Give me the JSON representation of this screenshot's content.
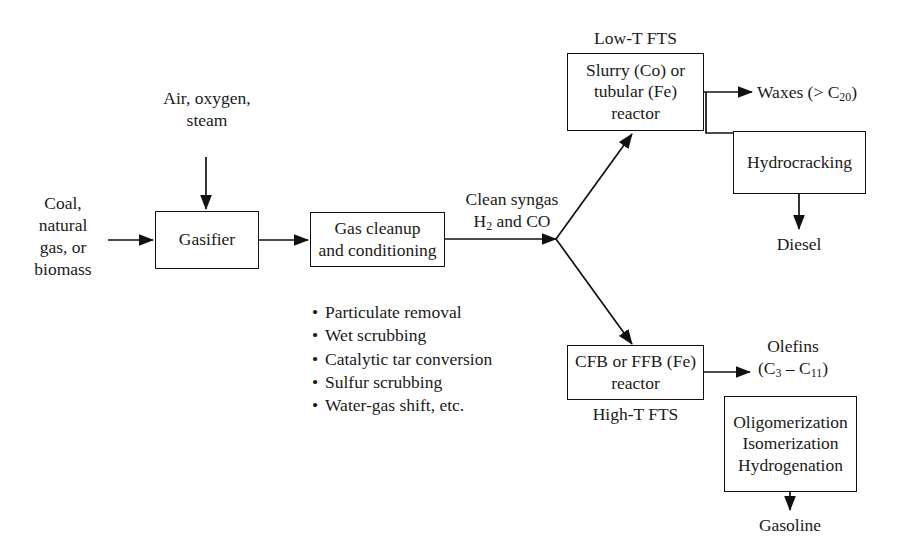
{
  "diagram": {
    "stroke_color": "#111111",
    "background_color": "#ffffff",
    "text_color": "#1a1a1a"
  },
  "inputs": {
    "feedstock_label": "Coal,\nnatural\ngas, or\nbiomass",
    "feedstock_line1": "Coal,",
    "feedstock_line2": "natural",
    "feedstock_line3": "gas, or",
    "feedstock_line4": "biomass",
    "oxidant_line1": "Air, oxygen,",
    "oxidant_line2": "steam"
  },
  "boxes": {
    "gasifier": "Gasifier",
    "gas_cleanup_line1": "Gas cleanup",
    "gas_cleanup_line2": "and conditioning",
    "lowt_reactor_line1": "Slurry (Co) or",
    "lowt_reactor_line2": "tubular (Fe)",
    "lowt_reactor_line3": "reactor",
    "hydrocracking": "Hydrocracking",
    "hight_reactor_line1": "CFB or FFB (Fe)",
    "hight_reactor_line2": "reactor",
    "upgrading_line1": "Oligomerization",
    "upgrading_line2": "Isomerization",
    "upgrading_line3": "Hydrogenation"
  },
  "annotations": {
    "low_t_fts": "Low-T FTS",
    "high_t_fts": "High-T FTS",
    "clean_syngas_line1": "Clean syngas",
    "clean_syngas_line2_prefix": "H",
    "clean_syngas_line2_sub": "2",
    "clean_syngas_line2_suffix": " and CO",
    "waxes_prefix": "Waxes (> C",
    "waxes_sub": "20",
    "waxes_suffix": ")",
    "olefins_line1": "Olefins",
    "olefins_line2_a": "(C",
    "olefins_line2_sub_a": "3",
    "olefins_line2_mid": " – C",
    "olefins_line2_sub_b": "11",
    "olefins_line2_end": ")"
  },
  "outputs": {
    "diesel": "Diesel",
    "gasoline": "Gasoline"
  },
  "cleanup_steps": {
    "bullet": "•",
    "items": [
      "Particulate removal",
      "Wet scrubbing",
      "Catalytic tar conversion",
      "Sulfur scrubbing",
      "Water-gas shift, etc."
    ]
  }
}
